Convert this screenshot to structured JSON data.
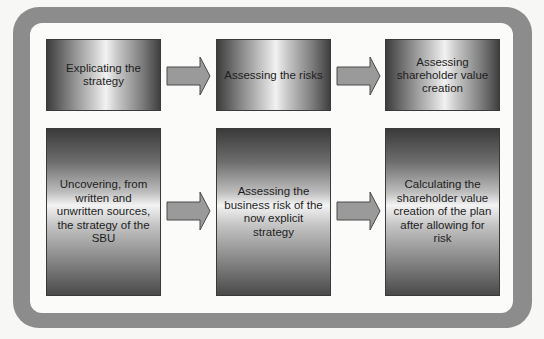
{
  "diagram": {
    "top_row": [
      {
        "label": "Explicating the strategy"
      },
      {
        "label": "Assessing the risks"
      },
      {
        "label": "Assessing shareholder value creation"
      }
    ],
    "bottom_row": [
      {
        "label": "Uncovering, from written and unwritten sources, the strategy of the SBU"
      },
      {
        "label": "Assessing the business risk of the now explicit strategy"
      },
      {
        "label": "Calculating the shareholder value creation of the plan after allowing for risk"
      }
    ],
    "arrows": [
      {
        "from": "top_row.0",
        "to": "top_row.1"
      },
      {
        "from": "top_row.1",
        "to": "top_row.2"
      },
      {
        "from": "bottom_row.0",
        "to": "bottom_row.1"
      },
      {
        "from": "bottom_row.1",
        "to": "bottom_row.2"
      }
    ],
    "colors": {
      "frame": "#8c8c8c",
      "inner_background": "#fbfbfa",
      "arrow_fill": "#9a9a9a",
      "arrow_stroke": "#4a4a4a",
      "text": "#1e1e1e"
    }
  }
}
